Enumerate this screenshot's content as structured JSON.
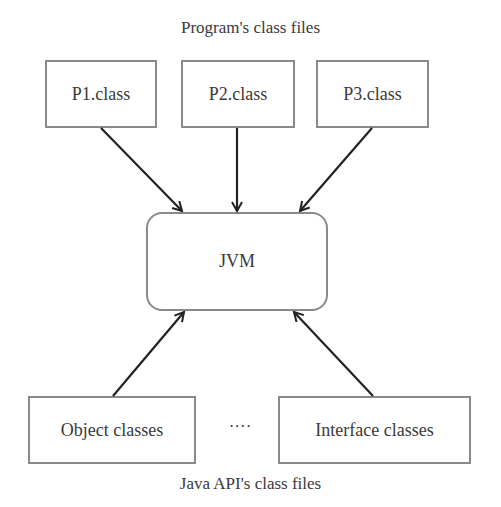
{
  "diagram": {
    "top_caption": "Program's class files",
    "bottom_caption": "Java API's class files",
    "program_classes": [
      {
        "label": "P1.class"
      },
      {
        "label": "P2.class"
      },
      {
        "label": "P3.class"
      }
    ],
    "center": {
      "label": "JVM"
    },
    "api_classes": [
      {
        "label": "Object classes"
      },
      {
        "label": "Interface classes"
      }
    ],
    "ellipsis": "····",
    "edges": [
      {
        "from": "P1.class",
        "to": "JVM"
      },
      {
        "from": "P2.class",
        "to": "JVM"
      },
      {
        "from": "P3.class",
        "to": "JVM"
      },
      {
        "from": "Object classes",
        "to": "JVM"
      },
      {
        "from": "Interface classes",
        "to": "JVM"
      }
    ]
  }
}
